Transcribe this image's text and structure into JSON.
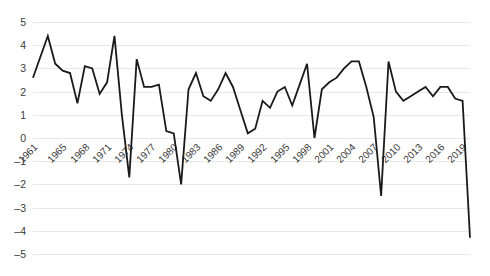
{
  "chart_data": {
    "type": "line",
    "title": "",
    "subtitle": "",
    "xlabel": "",
    "ylabel": "",
    "xlim": [
      1961,
      2020
    ],
    "ylim": [
      -5,
      5
    ],
    "grid": true,
    "legend": false,
    "line_color": "#1a1a1a",
    "grid_color": "#e8e8e8",
    "y_ticks": [
      5,
      4,
      3,
      2,
      1,
      0,
      -1,
      -2,
      -3,
      -4,
      -5
    ],
    "y_tick_labels": [
      "5",
      "4",
      "3",
      "2",
      "1",
      "0",
      "–1",
      "–2",
      "–3",
      "–4",
      "–5"
    ],
    "x_tick_labels": [
      "1961",
      "1965",
      "1968",
      "1971",
      "1974",
      "1977",
      "1980",
      "1983",
      "1986",
      "1989",
      "1992",
      "1995",
      "1998",
      "2001",
      "2004",
      "2007",
      "2010",
      "2013",
      "2016",
      "2019"
    ],
    "x_tick_years": [
      1961,
      1965,
      1968,
      1971,
      1974,
      1977,
      1980,
      1983,
      1986,
      1989,
      1992,
      1995,
      1998,
      2001,
      2004,
      2007,
      2010,
      2013,
      2016,
      2019
    ],
    "x": [
      1961,
      1962,
      1963,
      1964,
      1965,
      1966,
      1967,
      1968,
      1969,
      1970,
      1971,
      1972,
      1973,
      1974,
      1975,
      1976,
      1977,
      1978,
      1979,
      1980,
      1981,
      1982,
      1983,
      1984,
      1985,
      1986,
      1987,
      1988,
      1989,
      1990,
      1991,
      1992,
      1993,
      1994,
      1995,
      1996,
      1997,
      1998,
      1999,
      2000,
      2001,
      2002,
      2003,
      2004,
      2005,
      2006,
      2007,
      2008,
      2009,
      2010,
      2011,
      2012,
      2013,
      2014,
      2015,
      2016,
      2017,
      2018,
      2019,
      2020
    ],
    "values": [
      2.6,
      3.5,
      4.4,
      3.2,
      2.9,
      2.8,
      1.5,
      3.1,
      3.0,
      1.9,
      2.4,
      4.4,
      1.0,
      -1.7,
      3.4,
      2.2,
      2.2,
      2.3,
      0.3,
      0.2,
      -2.0,
      2.1,
      2.8,
      1.8,
      1.6,
      2.1,
      2.8,
      2.2,
      1.2,
      0.2,
      0.4,
      1.6,
      1.3,
      2.0,
      2.2,
      1.4,
      2.3,
      3.2,
      0.0,
      2.1,
      2.4,
      2.6,
      3.0,
      3.3,
      3.3,
      2.2,
      0.9,
      -2.5,
      3.3,
      2.0,
      1.6,
      1.8,
      2.0,
      2.2,
      1.8,
      2.2,
      2.2,
      1.7,
      1.6,
      -4.3
    ]
  }
}
